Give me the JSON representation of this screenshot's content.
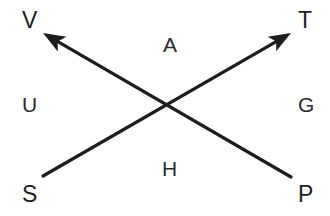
{
  "diagram": {
    "kind": "crossing-arrows",
    "background_color": "#ffffff",
    "stroke_color": "#1d1d1f",
    "stroke_width": 3.2,
    "canvas": {
      "width": 330,
      "height": 216
    },
    "intersection": {
      "x": 167,
      "y": 104
    },
    "arrows": [
      {
        "name": "arrow-S-to-T",
        "from_label": "S",
        "to_label": "T",
        "tail": {
          "x": 43,
          "y": 176
        },
        "head": {
          "x": 291,
          "y": 33
        },
        "arrowhead_at": "head"
      },
      {
        "name": "arrow-P-to-V",
        "from_label": "P",
        "to_label": "V",
        "tail": {
          "x": 291,
          "y": 177
        },
        "head": {
          "x": 43,
          "y": 33
        },
        "arrowhead_at": "head"
      }
    ],
    "vertex_labels": [
      {
        "id": "V",
        "text": "V",
        "position": "top-left"
      },
      {
        "id": "T",
        "text": "T",
        "position": "top-right"
      },
      {
        "id": "S",
        "text": "S",
        "position": "bottom-left"
      },
      {
        "id": "P",
        "text": "P",
        "position": "bottom-right"
      }
    ],
    "region_labels": [
      {
        "id": "A",
        "text": "A",
        "position": "top-center"
      },
      {
        "id": "U",
        "text": "U",
        "position": "middle-left"
      },
      {
        "id": "G",
        "text": "G",
        "position": "middle-right"
      },
      {
        "id": "H",
        "text": "H",
        "position": "bottom-center"
      }
    ]
  }
}
